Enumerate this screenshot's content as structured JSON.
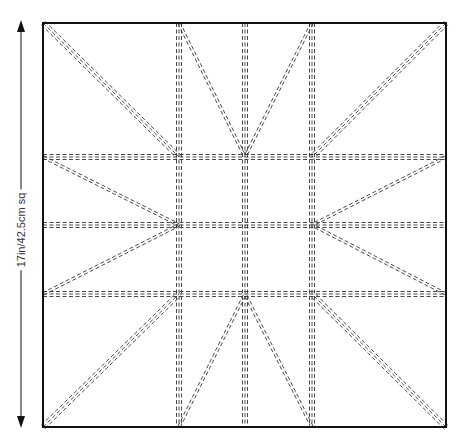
{
  "diagram": {
    "dimension_label": "17in/42.5cm sq",
    "square": {
      "x0": 43,
      "y0": 23,
      "x1": 446,
      "y1": 427
    },
    "grid_x": [
      179,
      245,
      312
    ],
    "grid_y": [
      157,
      225,
      294
    ],
    "line_color": "#333333",
    "border_color": "#111111"
  }
}
